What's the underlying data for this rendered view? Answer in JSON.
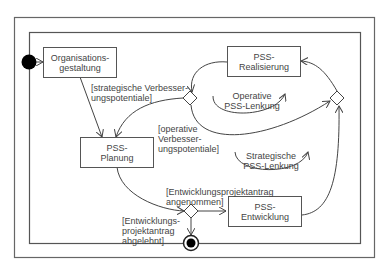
{
  "diagram": {
    "type": "UML activity diagram",
    "nodes": {
      "organisationsgestaltung": "Organisations-\ngestaltung",
      "pss_realisierung": "PSS-\nRealisierung",
      "pss_planung": "PSS-\nPlanung",
      "pss_entwicklung": "PSS-\nEntwicklung"
    },
    "guards": {
      "strategische": "[strategische Verbesser-\nungspotentiale]",
      "operative": "[operative\nVerbesser-\nungspotentiale]",
      "angenommen": "[Entwicklungsprojektantrag\nangenommen]",
      "abgelehnt": "[Entwicklungs-\nprojektantrag\nabgelehnt]"
    },
    "loops": {
      "operative": "Operative\nPSS-Lenkung",
      "strategische": "Strategische\nPSS-Lenkung"
    },
    "colors": {
      "stroke": "#555555",
      "fill": "#000000",
      "background": "#ffffff"
    }
  }
}
